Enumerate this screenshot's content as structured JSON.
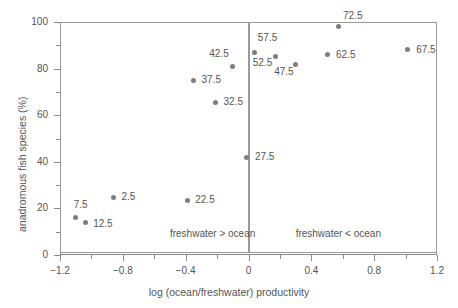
{
  "chart_data": {
    "type": "scatter",
    "title": "",
    "xlabel": "log (ocean/freshwater) productivity",
    "ylabel": "anadromous fish species (%)",
    "xlim": [
      -1.2,
      1.2
    ],
    "ylim": [
      0,
      100
    ],
    "xticks": [
      -1.2,
      -0.8,
      -0.4,
      0,
      0.4,
      0.8,
      1.2
    ],
    "xticklabels": [
      "−1.2",
      "−0.8",
      "−0.4",
      "0",
      "0.4",
      "0.8",
      "1.2"
    ],
    "yticks": [
      0,
      20,
      40,
      60,
      80,
      100
    ],
    "yticklabels": [
      "0",
      "20",
      "40",
      "60",
      "80",
      "100"
    ],
    "xminorticks": [
      -1.0,
      -0.6,
      -0.2,
      0.2,
      0.6,
      1.0
    ],
    "yminorticks": [
      10,
      30,
      50,
      70,
      90
    ],
    "grid": false,
    "legend": false,
    "marker_color": "#7d7d7d",
    "axis_color": "#8a8a8a",
    "points": [
      {
        "label": "7.5",
        "x": -1.1,
        "y": 16,
        "label_dx": -2,
        "label_dy": -13,
        "label_align": "left"
      },
      {
        "label": "12.5",
        "x": -1.04,
        "y": 14,
        "label_dx": 8,
        "label_dy": 2,
        "label_align": "left"
      },
      {
        "label": "2.5",
        "x": -0.86,
        "y": 24.5,
        "label_dx": 8,
        "label_dy": -1,
        "label_align": "left"
      },
      {
        "label": "22.5",
        "x": -0.39,
        "y": 23.5,
        "label_dx": 8,
        "label_dy": 0,
        "label_align": "left"
      },
      {
        "label": "27.5",
        "x": -0.01,
        "y": 42,
        "label_dx": 8,
        "label_dy": 0,
        "label_align": "left"
      },
      {
        "label": "32.5",
        "x": -0.21,
        "y": 65.5,
        "label_dx": 8,
        "label_dy": 0,
        "label_align": "left"
      },
      {
        "label": "37.5",
        "x": -0.35,
        "y": 75,
        "label_dx": 8,
        "label_dy": 0,
        "label_align": "left"
      },
      {
        "label": "42.5",
        "x": -0.1,
        "y": 80.8,
        "label_dx": -4,
        "label_dy": -13,
        "label_align": "right"
      },
      {
        "label": "57.5",
        "x": 0.04,
        "y": 87,
        "label_dx": 3,
        "label_dy": -14,
        "label_align": "left"
      },
      {
        "label": "52.5",
        "x": 0.17,
        "y": 85,
        "label_dx": -3,
        "label_dy": 6,
        "label_align": "right"
      },
      {
        "label": "47.5",
        "x": 0.3,
        "y": 81.7,
        "label_dx": -2,
        "label_dy": 7,
        "label_align": "right"
      },
      {
        "label": "62.5",
        "x": 0.5,
        "y": 86,
        "label_dx": 9,
        "label_dy": 0,
        "label_align": "left"
      },
      {
        "label": "72.5",
        "x": 0.57,
        "y": 98,
        "label_dx": 5,
        "label_dy": -11,
        "label_align": "left"
      },
      {
        "label": "67.5",
        "x": 1.01,
        "y": 88,
        "label_dx": 9,
        "label_dy": 0,
        "label_align": "left"
      }
    ],
    "annotations": [
      {
        "text": "freshwater > ocean",
        "x": -0.5,
        "y": 9
      },
      {
        "text": "freshwater < ocean",
        "x": 0.3,
        "y": 9
      }
    ],
    "regions": [
      {
        "name": "freshwater-greater-region",
        "x0": -1.2,
        "x1": 0.0,
        "y0": 1.0,
        "y1": 100
      },
      {
        "name": "freshwater-less-region",
        "x0": 0.0,
        "x1": 1.2,
        "y0": 1.0,
        "y1": 100
      }
    ]
  }
}
